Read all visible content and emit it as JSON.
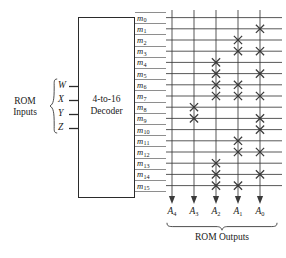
{
  "diagram": {
    "input_group_label_line1": "ROM",
    "input_group_label_line2": "Inputs",
    "output_group_label": "ROM Outputs",
    "decoder": {
      "label_line1": "4-to-16",
      "label_line2": "Decoder"
    },
    "inputs": [
      {
        "name": "W"
      },
      {
        "name": "X"
      },
      {
        "name": "Y"
      },
      {
        "name": "Z"
      }
    ],
    "minterms": [
      {
        "base": "m",
        "index": "0"
      },
      {
        "base": "m",
        "index": "1"
      },
      {
        "base": "m",
        "index": "2"
      },
      {
        "base": "m",
        "index": "3"
      },
      {
        "base": "m",
        "index": "4"
      },
      {
        "base": "m",
        "index": "5"
      },
      {
        "base": "m",
        "index": "6"
      },
      {
        "base": "m",
        "index": "7"
      },
      {
        "base": "m",
        "index": "8"
      },
      {
        "base": "m",
        "index": "9"
      },
      {
        "base": "m",
        "index": "10"
      },
      {
        "base": "m",
        "index": "11"
      },
      {
        "base": "m",
        "index": "12"
      },
      {
        "base": "m",
        "index": "13"
      },
      {
        "base": "m",
        "index": "14"
      },
      {
        "base": "m",
        "index": "15"
      }
    ],
    "outputs": [
      {
        "base": "A",
        "index": "4"
      },
      {
        "base": "A",
        "index": "3"
      },
      {
        "base": "A",
        "index": "2"
      },
      {
        "base": "A",
        "index": "1"
      },
      {
        "base": "A",
        "index": "0"
      }
    ],
    "connection_matrix": [
      [
        0,
        0,
        0,
        0,
        0
      ],
      [
        0,
        0,
        0,
        0,
        1
      ],
      [
        0,
        0,
        0,
        1,
        0
      ],
      [
        0,
        0,
        0,
        1,
        1
      ],
      [
        0,
        0,
        1,
        0,
        0
      ],
      [
        0,
        0,
        1,
        0,
        1
      ],
      [
        0,
        0,
        1,
        1,
        0
      ],
      [
        0,
        0,
        1,
        1,
        1
      ],
      [
        0,
        1,
        0,
        0,
        0
      ],
      [
        0,
        1,
        0,
        0,
        1
      ],
      [
        0,
        0,
        0,
        0,
        1
      ],
      [
        0,
        0,
        0,
        1,
        0
      ],
      [
        0,
        0,
        0,
        1,
        1
      ],
      [
        0,
        0,
        1,
        0,
        0
      ],
      [
        0,
        0,
        1,
        0,
        1
      ],
      [
        0,
        0,
        1,
        1,
        0
      ]
    ],
    "colors": {
      "line": "#3a3a3a",
      "minterm_line": "#8e8e8e",
      "box_border": "#2b2b2b",
      "text": "#1a1a1a",
      "background": "#ffffff"
    },
    "geometry": {
      "grid_left": 166,
      "grid_right": 282,
      "column_x": [
        172,
        194,
        216,
        238,
        260
      ],
      "row_y_start": 17.6,
      "row_pitch": 11.2,
      "row_count": 16,
      "column_count": 5
    }
  }
}
